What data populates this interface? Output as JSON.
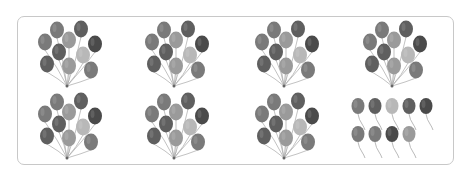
{
  "figure": {
    "bunch_size": 10,
    "bunches_count": 7,
    "loose_balloons_count": 9,
    "total_balloons": 79,
    "colors": {
      "frame": "#c8c8c8",
      "dark": "#4a4a4a",
      "mid_dark": "#5f5f5f",
      "mid": "#7a7a7a",
      "light": "#9a9a9a",
      "lightest": "#b8b8b8",
      "string": "#a8a8a8"
    },
    "cells": [
      {
        "type": "bunch",
        "count": 10
      },
      {
        "type": "bunch",
        "count": 10
      },
      {
        "type": "bunch",
        "count": 10
      },
      {
        "type": "bunch",
        "count": 10
      },
      {
        "type": "bunch",
        "count": 10
      },
      {
        "type": "bunch",
        "count": 10
      },
      {
        "type": "bunch",
        "count": 10
      },
      {
        "type": "loose",
        "count": 9
      }
    ]
  }
}
